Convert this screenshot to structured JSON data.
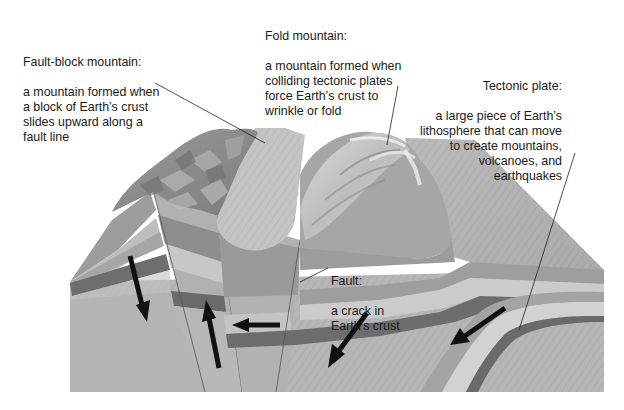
{
  "labels": {
    "fault_block": {
      "title": "Fault-block mountain:",
      "description": "a mountain formed when\na block of Earth’s crust\nslides upward along a\nfault line"
    },
    "fold": {
      "title": "Fold mountain:",
      "description": "a mountain formed when\ncolliding tectonic plates\nforce Earth’s crust to\nwrinkle or fold"
    },
    "tectonic_plate": {
      "title": "Tectonic plate:",
      "description": "a large piece of Earth’s\nlithosphere that can move\nto create mountains,\nvolcanoes, and\nearthquakes"
    },
    "fault": {
      "title": "Fault:",
      "description": "a crack in\nEarth’s crust"
    }
  },
  "arrows": [
    {
      "name": "left-block-down",
      "direction": "down"
    },
    {
      "name": "fault-block-up",
      "direction": "up"
    },
    {
      "name": "valley-left",
      "direction": "left"
    },
    {
      "name": "center-down-left",
      "direction": "down-left"
    },
    {
      "name": "plate-subduction",
      "direction": "down-left"
    }
  ],
  "colors": {
    "background": "#ffffff",
    "crust_light": "#b9b9b9",
    "crust_mid": "#a3a3a3",
    "crust_dark": "#6f6f6f",
    "band_light": "#cfcfcf",
    "mountain_dark": "#8a8a8a",
    "mountain_light": "#dcdcdc",
    "arrow": "#111111",
    "text": "#1a1a1a"
  }
}
